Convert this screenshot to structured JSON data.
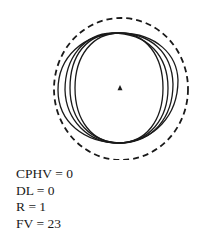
{
  "diagram": {
    "colors": {
      "stroke": "#1a1a1a",
      "background": "#ffffff"
    },
    "center_marker": {
      "shape": "triangle-icon",
      "x": 120,
      "y": 88,
      "size": 5
    },
    "reference_circle": {
      "style": "dashed",
      "cx": 121,
      "cy": 89,
      "rx": 67,
      "ry": 71
    },
    "curves": [
      {
        "d": "M 120 33 C 92 33 75 56 75 88 C 75 120 92 143 119 143 C 146 143 163 120 163 88 C 163 56 146 33 120 33 Z"
      },
      {
        "d": "M 112 33 C 84 34 65 58 65 90 C 66 120 88 143 118 143 C 150 143 168 118 168 88 C 168 56 148 33 112 33 Z"
      },
      {
        "d": "M 118 33 C 86 33 70 56 70 88 C 70 120 90 143 122 143 C 152 142 173 118 173 84 C 172 52 150 33 118 33 Z"
      },
      {
        "d": "M 122 33 C 82 33 58 58 58 90 C 58 122 84 143 120 143 C 154 141 178 116 178 80 C 177 54 156 34 122 33 Z"
      }
    ]
  },
  "legend": {
    "lines": [
      "CPHV = 0",
      "DL = 0",
      "R = 1",
      "FV = 23"
    ]
  }
}
